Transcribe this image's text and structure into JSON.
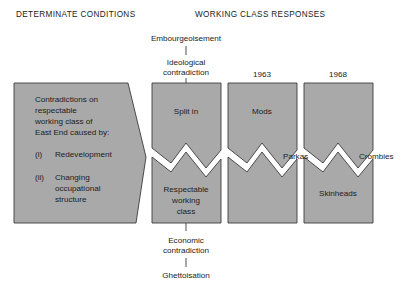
{
  "headers": {
    "left": "DETERMINATE CONDITIONS",
    "right": "WORKING CLASS RESPONSES"
  },
  "top_chain": {
    "outer": "Embourgeoisement",
    "inner_line1": "Ideological",
    "inner_line2": "contradiction"
  },
  "bottom_chain": {
    "inner_line1": "Economic",
    "inner_line2": "contradiction",
    "outer": "Ghettoisation"
  },
  "years": {
    "col3": "1963",
    "col4": "1968"
  },
  "left_block": {
    "line1": "Contradictions on",
    "line2": "respectable",
    "line3": "working class of",
    "line4": "East End caused by:",
    "item1_marker": "(i)",
    "item1_text": "Redevelopment",
    "item2_marker": "(ii)",
    "item2_line1": "Changing",
    "item2_line2": "occupational",
    "item2_line3": "structure"
  },
  "columns": [
    {
      "id": "split-column",
      "top_label": "Split in",
      "bottom_label_line1": "Respectable",
      "bottom_label_line2": "working",
      "bottom_label_line3": "class"
    },
    {
      "id": "mods-column",
      "top_label": "Mods",
      "bottom_label_line1": "",
      "bottom_label_line2": "",
      "bottom_label_line3": ""
    },
    {
      "id": "skinheads-column",
      "top_label": "",
      "bottom_label_line1": "Skinheads",
      "bottom_label_line2": "",
      "bottom_label_line3": ""
    }
  ],
  "gap_labels": {
    "parkas": "Parkas",
    "crombies": "Crombies"
  },
  "colors": {
    "fill": "#aaa9a9",
    "stroke": "#3c3c3c",
    "text": "#1b1b1b",
    "background": "#ffffff"
  }
}
